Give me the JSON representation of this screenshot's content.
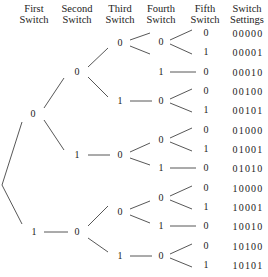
{
  "headers": [
    {
      "line1": "First",
      "line2": "Switch",
      "x": 34
    },
    {
      "line1": "Second",
      "line2": "Switch",
      "x": 77
    },
    {
      "line1": "Third",
      "line2": "Switch",
      "x": 120
    },
    {
      "line1": "Fourth",
      "line2": "Switch",
      "x": 161
    },
    {
      "line1": "Fifth",
      "line2": "Switch",
      "x": 205
    },
    {
      "line1": "Switch",
      "line2": "Settings",
      "x": 247
    }
  ],
  "nodes": [
    {
      "id": "s1a",
      "label": "0",
      "x": 33,
      "y": 114
    },
    {
      "id": "s1b",
      "label": "1",
      "x": 34,
      "y": 232
    },
    {
      "id": "s2a",
      "label": "0",
      "x": 77,
      "y": 72
    },
    {
      "id": "s2b",
      "label": "1",
      "x": 77,
      "y": 155
    },
    {
      "id": "s2c",
      "label": "0",
      "x": 77,
      "y": 232
    },
    {
      "id": "s3a",
      "label": "0",
      "x": 120,
      "y": 43
    },
    {
      "id": "s3b",
      "label": "1",
      "x": 120,
      "y": 101
    },
    {
      "id": "s3c",
      "label": "0",
      "x": 120,
      "y": 155
    },
    {
      "id": "s3d",
      "label": "0",
      "x": 120,
      "y": 212
    },
    {
      "id": "s3e",
      "label": "1",
      "x": 120,
      "y": 256
    },
    {
      "id": "s4a",
      "label": "0",
      "x": 161,
      "y": 42
    },
    {
      "id": "s4b",
      "label": "1",
      "x": 161,
      "y": 72
    },
    {
      "id": "s4c",
      "label": "0",
      "x": 161,
      "y": 101
    },
    {
      "id": "s4d",
      "label": "0",
      "x": 161,
      "y": 140
    },
    {
      "id": "s4e",
      "label": "1",
      "x": 161,
      "y": 168
    },
    {
      "id": "s4f",
      "label": "0",
      "x": 161,
      "y": 198
    },
    {
      "id": "s4g",
      "label": "1",
      "x": 161,
      "y": 226
    },
    {
      "id": "s4h",
      "label": "0",
      "x": 161,
      "y": 256
    },
    {
      "id": "s5a",
      "label": "0",
      "x": 206,
      "y": 33
    },
    {
      "id": "s5b",
      "label": "1",
      "x": 206,
      "y": 52
    },
    {
      "id": "s5c",
      "label": "0",
      "x": 206,
      "y": 72
    },
    {
      "id": "s5d",
      "label": "0",
      "x": 206,
      "y": 91
    },
    {
      "id": "s5e",
      "label": "1",
      "x": 206,
      "y": 110
    },
    {
      "id": "s5f",
      "label": "0",
      "x": 206,
      "y": 130
    },
    {
      "id": "s5g",
      "label": "1",
      "x": 206,
      "y": 149
    },
    {
      "id": "s5h",
      "label": "0",
      "x": 206,
      "y": 168
    },
    {
      "id": "s5i",
      "label": "0",
      "x": 206,
      "y": 188
    },
    {
      "id": "s5j",
      "label": "1",
      "x": 206,
      "y": 207
    },
    {
      "id": "s5k",
      "label": "0",
      "x": 206,
      "y": 226
    },
    {
      "id": "s5l",
      "label": "0",
      "x": 206,
      "y": 246
    },
    {
      "id": "s5m",
      "label": "1",
      "x": 206,
      "y": 265
    }
  ],
  "settings": [
    {
      "value": "00000",
      "y": 33
    },
    {
      "value": "00001",
      "y": 52
    },
    {
      "value": "00010",
      "y": 72
    },
    {
      "value": "00100",
      "y": 91
    },
    {
      "value": "00101",
      "y": 110
    },
    {
      "value": "01000",
      "y": 130
    },
    {
      "value": "01001",
      "y": 149
    },
    {
      "value": "01010",
      "y": 168
    },
    {
      "value": "10000",
      "y": 188
    },
    {
      "value": "10001",
      "y": 207
    },
    {
      "value": "10010",
      "y": 226
    },
    {
      "value": "10100",
      "y": 246
    },
    {
      "value": "10101",
      "y": 265
    }
  ],
  "edges": [
    [
      2,
      185,
      22,
      122
    ],
    [
      2,
      185,
      22,
      224
    ],
    [
      44,
      108,
      64,
      78
    ],
    [
      44,
      120,
      64,
      150
    ],
    [
      44,
      232,
      68,
      232
    ],
    [
      88,
      67,
      108,
      48
    ],
    [
      88,
      77,
      108,
      97
    ],
    [
      88,
      155,
      110,
      155
    ],
    [
      88,
      226,
      108,
      206
    ],
    [
      88,
      238,
      108,
      252
    ],
    [
      130,
      40,
      150,
      33
    ],
    [
      130,
      46,
      150,
      54
    ],
    [
      130,
      101,
      152,
      101
    ],
    [
      130,
      152,
      150,
      143
    ],
    [
      130,
      158,
      150,
      165
    ],
    [
      130,
      209,
      150,
      201
    ],
    [
      130,
      215,
      150,
      223
    ],
    [
      130,
      256,
      152,
      256
    ],
    [
      170,
      40,
      192,
      30
    ],
    [
      170,
      44,
      192,
      54
    ],
    [
      170,
      72,
      196,
      72
    ],
    [
      170,
      99,
      192,
      89
    ],
    [
      170,
      103,
      192,
      112
    ],
    [
      170,
      138,
      192,
      128
    ],
    [
      170,
      142,
      192,
      151
    ],
    [
      170,
      168,
      196,
      168
    ],
    [
      170,
      196,
      192,
      186
    ],
    [
      170,
      200,
      192,
      209
    ],
    [
      170,
      226,
      196,
      226
    ],
    [
      170,
      254,
      192,
      244
    ],
    [
      170,
      258,
      192,
      267
    ]
  ]
}
